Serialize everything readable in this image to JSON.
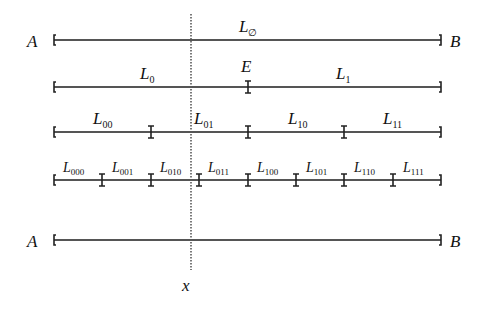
{
  "diagram": {
    "endpoints": {
      "left": "A",
      "right": "B"
    },
    "point_label": "x",
    "midpoint_label": "E",
    "levels": [
      {
        "y": 40,
        "segments": [
          {
            "L": "L",
            "sub": "∅"
          }
        ],
        "show_AB": true
      },
      {
        "y": 87,
        "segments": [
          {
            "L": "L",
            "sub": "0"
          },
          {
            "L": "L",
            "sub": "1"
          }
        ],
        "show_AB": false
      },
      {
        "y": 132,
        "segments": [
          {
            "L": "L",
            "sub": "00"
          },
          {
            "L": "L",
            "sub": "01"
          },
          {
            "L": "L",
            "sub": "10"
          },
          {
            "L": "L",
            "sub": "11"
          }
        ],
        "show_AB": false
      },
      {
        "y": 180,
        "segments": [
          {
            "L": "L",
            "sub": "000"
          },
          {
            "L": "L",
            "sub": "001"
          },
          {
            "L": "L",
            "sub": "010"
          },
          {
            "L": "L",
            "sub": "011"
          },
          {
            "L": "L",
            "sub": "100"
          },
          {
            "L": "L",
            "sub": "101"
          },
          {
            "L": "L",
            "sub": "110"
          },
          {
            "L": "L",
            "sub": "111"
          }
        ],
        "show_AB": false
      },
      {
        "y": 240,
        "segments": [],
        "show_AB": true
      }
    ],
    "colors": {
      "line": "#555555",
      "text": "#111111"
    }
  }
}
